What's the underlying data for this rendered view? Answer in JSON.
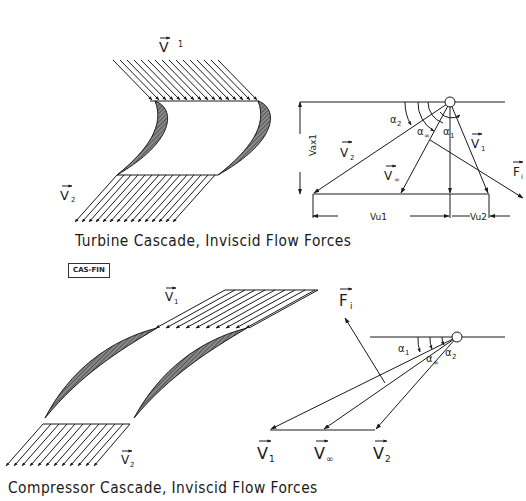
{
  "turbine": {
    "caption": "Turbine Cascade, Inviscid Flow Forces",
    "tag": "CAS-FIN",
    "inlet_label": "V",
    "inlet_sub": "1",
    "outlet_label": "V",
    "outlet_sub": "2",
    "triangle": {
      "v1": "V",
      "v1_sub": "1",
      "v2": "V",
      "v2_sub": "2",
      "vinf": "V",
      "vinf_sub": "∞",
      "fi": "F",
      "fi_sub": "i",
      "alpha1": "α",
      "alpha1_sub": "1",
      "alpha2": "α",
      "alpha2_sub": "2",
      "alphainf": "α",
      "alphainf_sub": "∞",
      "vax1": "Vax1",
      "vu1": "Vu1",
      "vu2": "Vu2"
    }
  },
  "compressor": {
    "caption": "Compressor Cascade, Inviscid Flow Forces",
    "inlet_label": "V",
    "inlet_sub": "1",
    "outlet_label": "V",
    "outlet_sub": "2",
    "triangle": {
      "v1": "V",
      "v1_sub": "1",
      "v2": "V",
      "v2_sub": "2",
      "vinf": "V",
      "vinf_sub": "∞",
      "fi": "F",
      "fi_sub": "i",
      "alpha1": "α",
      "alpha1_sub": "1",
      "alpha2": "α",
      "alpha2_sub": "2",
      "alphainf": "α",
      "alphainf_sub": "∞"
    }
  },
  "colors": {
    "ink": "#1a1a1a",
    "blade_fill": "#6e6e6e",
    "background": "#ffffff"
  }
}
